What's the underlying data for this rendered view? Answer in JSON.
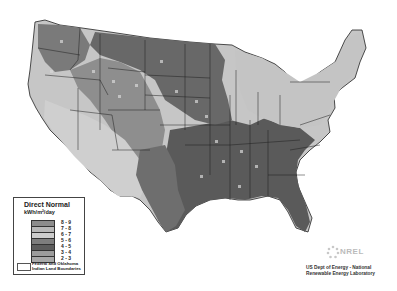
{
  "map": {
    "title": "Direct Normal",
    "units": "kWh/m²/day",
    "region": "Contiguous United States",
    "colors": {
      "background": "#ffffff",
      "state_border": "#1e1e1e",
      "class_8_9": "#8c8c8c",
      "class_7_8": "#b5b5b5",
      "class_6_7": "#c9c9c9",
      "class_5_6": "#7a7a7a",
      "class_4_5": "#5a5a5a",
      "class_3_4": "#9a9a9a",
      "class_2_3": "#ababab"
    }
  },
  "legend": {
    "title": "Direct Normal",
    "units": "kWh/m²/day",
    "items": [
      {
        "label": "8 - 9",
        "color": "#8c8c8c"
      },
      {
        "label": "7 - 8",
        "color": "#b8b8b8"
      },
      {
        "label": "6 - 7",
        "color": "#cdcdcd"
      },
      {
        "label": "5 - 6",
        "color": "#7d7d7d"
      },
      {
        "label": "4 - 5",
        "color": "#5c5c5c"
      },
      {
        "label": "3 - 4",
        "color": "#9c9c9c"
      },
      {
        "label": "2 - 3",
        "color": "#a8a8a8"
      }
    ],
    "boundary_label": "Federal and Oklahoma Indian Land Boundaries"
  },
  "credit": {
    "logo": "NREL",
    "line1": "US Dept of Energy - National",
    "line2": "Renewable Energy Laboratory"
  }
}
